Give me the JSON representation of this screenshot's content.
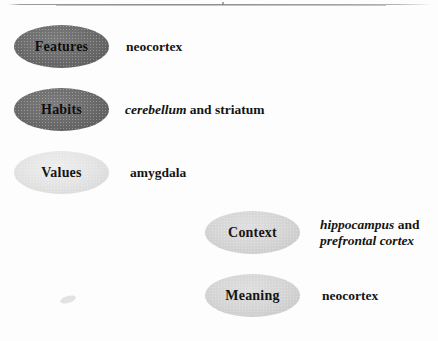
{
  "figure": {
    "top_rule": "horizontal-rule",
    "rows": [
      {
        "id": "features",
        "label": "Features",
        "ellipse_shade": "dark",
        "ellipse_color": "#6d6d6d",
        "annotation_lines": [
          [
            {
              "text": "neocortex",
              "style": "roman"
            }
          ]
        ]
      },
      {
        "id": "habits",
        "label": "Habits",
        "ellipse_shade": "dark",
        "ellipse_color": "#6d6d6d",
        "annotation_lines": [
          [
            {
              "text": "cerebellum",
              "style": "italic"
            },
            {
              "text": " and striatum",
              "style": "roman"
            }
          ]
        ]
      },
      {
        "id": "values",
        "label": "Values",
        "ellipse_shade": "pale",
        "ellipse_color": "#e2e2e2",
        "annotation_lines": [
          [
            {
              "text": "amygdala",
              "style": "roman"
            }
          ]
        ]
      },
      {
        "id": "context",
        "label": "Context",
        "ellipse_shade": "light",
        "ellipse_color": "#d2d2d2",
        "annotation_lines": [
          [
            {
              "text": "hippocampus",
              "style": "italic"
            },
            {
              "text": " and",
              "style": "roman"
            }
          ],
          [
            {
              "text": "prefrontal cortex",
              "style": "italic"
            }
          ]
        ]
      },
      {
        "id": "meaning",
        "label": "Meaning",
        "ellipse_shade": "light",
        "ellipse_color": "#d2d2d2",
        "annotation_lines": [
          [
            {
              "text": "neocortex",
              "style": "roman"
            }
          ]
        ]
      }
    ]
  }
}
